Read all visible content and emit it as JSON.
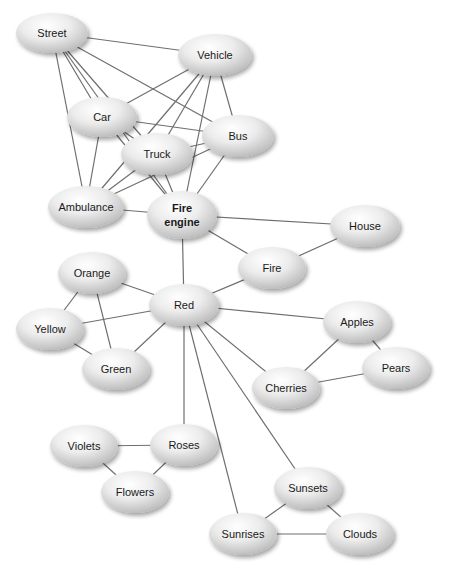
{
  "diagram": {
    "type": "semantic-network",
    "colors": {
      "edge": "#6f6f6f",
      "node_light": "#ffffff",
      "node_dark": "#bdbdbd",
      "shadow": "#cfcfcf",
      "text": "#1a1a1a"
    },
    "nodes": [
      {
        "id": "street",
        "label": "Street",
        "x": 52,
        "y": 33,
        "rx": 36,
        "ry": 20
      },
      {
        "id": "vehicle",
        "label": "Vehicle",
        "x": 215,
        "y": 55,
        "rx": 37,
        "ry": 21
      },
      {
        "id": "car",
        "label": "Car",
        "x": 102,
        "y": 117,
        "rx": 35,
        "ry": 20
      },
      {
        "id": "bus",
        "label": "Bus",
        "x": 238,
        "y": 136,
        "rx": 36,
        "ry": 21
      },
      {
        "id": "truck",
        "label": "Truck",
        "x": 157,
        "y": 154,
        "rx": 36,
        "ry": 21
      },
      {
        "id": "ambulance",
        "label": "Ambulance",
        "x": 86,
        "y": 207,
        "rx": 38,
        "ry": 21
      },
      {
        "id": "fire_engine",
        "label": "Fire engine",
        "lines": [
          "Fire",
          "engine"
        ],
        "x": 182,
        "y": 215,
        "rx": 35,
        "ry": 24,
        "bold": true
      },
      {
        "id": "house",
        "label": "House",
        "x": 365,
        "y": 226,
        "rx": 35,
        "ry": 21
      },
      {
        "id": "fire",
        "label": "Fire",
        "x": 272,
        "y": 268,
        "rx": 34,
        "ry": 21
      },
      {
        "id": "orange",
        "label": "Orange",
        "x": 92,
        "y": 273,
        "rx": 34,
        "ry": 21
      },
      {
        "id": "red",
        "label": "Red",
        "x": 184,
        "y": 305,
        "rx": 35,
        "ry": 21
      },
      {
        "id": "yellow",
        "label": "Yellow",
        "x": 50,
        "y": 329,
        "rx": 34,
        "ry": 21
      },
      {
        "id": "green",
        "label": "Green",
        "x": 116,
        "y": 369,
        "rx": 34,
        "ry": 21
      },
      {
        "id": "apples",
        "label": "Apples",
        "x": 357,
        "y": 322,
        "rx": 34,
        "ry": 21
      },
      {
        "id": "pears",
        "label": "Pears",
        "x": 396,
        "y": 368,
        "rx": 34,
        "ry": 21
      },
      {
        "id": "cherries",
        "label": "Cherries",
        "x": 286,
        "y": 388,
        "rx": 34,
        "ry": 21
      },
      {
        "id": "violets",
        "label": "Violets",
        "x": 84,
        "y": 446,
        "rx": 34,
        "ry": 21
      },
      {
        "id": "roses",
        "label": "Roses",
        "x": 184,
        "y": 445,
        "rx": 34,
        "ry": 21
      },
      {
        "id": "flowers",
        "label": "Flowers",
        "x": 135,
        "y": 492,
        "rx": 34,
        "ry": 21
      },
      {
        "id": "sunsets",
        "label": "Sunsets",
        "x": 308,
        "y": 488,
        "rx": 34,
        "ry": 21
      },
      {
        "id": "sunrises",
        "label": "Sunrises",
        "x": 243,
        "y": 534,
        "rx": 34,
        "ry": 21
      },
      {
        "id": "clouds",
        "label": "Clouds",
        "x": 360,
        "y": 534,
        "rx": 34,
        "ry": 21
      }
    ],
    "edges": [
      [
        "street",
        "vehicle"
      ],
      [
        "street",
        "car"
      ],
      [
        "street",
        "bus"
      ],
      [
        "street",
        "truck"
      ],
      [
        "street",
        "ambulance"
      ],
      [
        "street",
        "fire_engine"
      ],
      [
        "vehicle",
        "car"
      ],
      [
        "vehicle",
        "bus"
      ],
      [
        "vehicle",
        "truck"
      ],
      [
        "vehicle",
        "ambulance"
      ],
      [
        "vehicle",
        "fire_engine"
      ],
      [
        "car",
        "bus"
      ],
      [
        "car",
        "truck"
      ],
      [
        "car",
        "ambulance"
      ],
      [
        "car",
        "fire_engine"
      ],
      [
        "truck",
        "bus"
      ],
      [
        "truck",
        "ambulance"
      ],
      [
        "truck",
        "fire_engine"
      ],
      [
        "bus",
        "ambulance"
      ],
      [
        "bus",
        "fire_engine"
      ],
      [
        "ambulance",
        "fire_engine"
      ],
      [
        "fire_engine",
        "house"
      ],
      [
        "fire_engine",
        "fire"
      ],
      [
        "fire_engine",
        "red"
      ],
      [
        "house",
        "fire"
      ],
      [
        "fire",
        "red"
      ],
      [
        "red",
        "orange"
      ],
      [
        "red",
        "yellow"
      ],
      [
        "red",
        "green"
      ],
      [
        "orange",
        "yellow"
      ],
      [
        "orange",
        "green"
      ],
      [
        "yellow",
        "green"
      ],
      [
        "red",
        "apples"
      ],
      [
        "red",
        "cherries"
      ],
      [
        "red",
        "roses"
      ],
      [
        "red",
        "sunrises"
      ],
      [
        "red",
        "sunsets"
      ],
      [
        "apples",
        "pears"
      ],
      [
        "apples",
        "cherries"
      ],
      [
        "cherries",
        "pears"
      ],
      [
        "violets",
        "roses"
      ],
      [
        "violets",
        "flowers"
      ],
      [
        "roses",
        "flowers"
      ],
      [
        "sunsets",
        "sunrises"
      ],
      [
        "sunsets",
        "clouds"
      ],
      [
        "sunrises",
        "clouds"
      ]
    ]
  }
}
